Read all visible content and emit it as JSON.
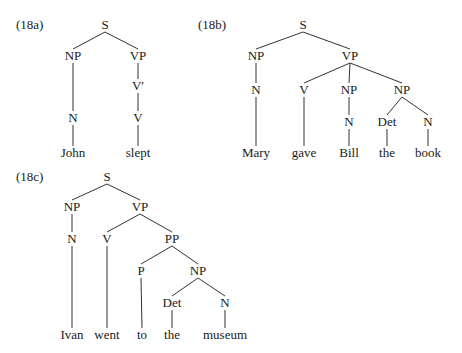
{
  "examples": [
    {
      "id": "18a",
      "label": "(18a)",
      "label_pos": [
        16,
        25
      ],
      "nodes": [
        {
          "text": "S",
          "x": 105,
          "y": 25
        },
        {
          "text": "NP",
          "x": 73,
          "y": 56
        },
        {
          "text": "VP",
          "x": 138,
          "y": 56
        },
        {
          "text": "V′",
          "x": 138,
          "y": 86
        },
        {
          "text": "N",
          "x": 73,
          "y": 118
        },
        {
          "text": "V",
          "x": 138,
          "y": 118
        },
        {
          "text": "John",
          "x": 73,
          "y": 153
        },
        {
          "text": "slept",
          "x": 138,
          "y": 153
        }
      ],
      "edges": [
        [
          0,
          1
        ],
        [
          0,
          2
        ],
        [
          2,
          3
        ],
        [
          3,
          5
        ],
        [
          1,
          4
        ],
        [
          4,
          6
        ],
        [
          5,
          7
        ]
      ]
    },
    {
      "id": "18b",
      "label": "(18b)",
      "label_pos": [
        198,
        25
      ],
      "nodes": [
        {
          "text": "S",
          "x": 303,
          "y": 25
        },
        {
          "text": "NP",
          "x": 256,
          "y": 56
        },
        {
          "text": "VP",
          "x": 350,
          "y": 56
        },
        {
          "text": "N",
          "x": 256,
          "y": 90
        },
        {
          "text": "V",
          "x": 304,
          "y": 90
        },
        {
          "text": "NP",
          "x": 349,
          "y": 90
        },
        {
          "text": "NP",
          "x": 402,
          "y": 90
        },
        {
          "text": "N",
          "x": 349,
          "y": 122
        },
        {
          "text": "Det",
          "x": 387,
          "y": 122
        },
        {
          "text": "N",
          "x": 428,
          "y": 122
        },
        {
          "text": "Mary",
          "x": 256,
          "y": 153
        },
        {
          "text": "gave",
          "x": 304,
          "y": 153
        },
        {
          "text": "Bill",
          "x": 349,
          "y": 153
        },
        {
          "text": "the",
          "x": 387,
          "y": 153
        },
        {
          "text": "book",
          "x": 428,
          "y": 153
        }
      ],
      "edges": [
        [
          0,
          1
        ],
        [
          0,
          2
        ],
        [
          1,
          3
        ],
        [
          2,
          4
        ],
        [
          2,
          5
        ],
        [
          2,
          6
        ],
        [
          5,
          7
        ],
        [
          6,
          8
        ],
        [
          6,
          9
        ],
        [
          3,
          10
        ],
        [
          4,
          11
        ],
        [
          7,
          12
        ],
        [
          8,
          13
        ],
        [
          9,
          14
        ]
      ]
    },
    {
      "id": "18c",
      "label": "(18c)",
      "label_pos": [
        16,
        177
      ],
      "nodes": [
        {
          "text": "S",
          "x": 107,
          "y": 177
        },
        {
          "text": "NP",
          "x": 72,
          "y": 207
        },
        {
          "text": "VP",
          "x": 140,
          "y": 207
        },
        {
          "text": "N",
          "x": 72,
          "y": 239
        },
        {
          "text": "V",
          "x": 107,
          "y": 239
        },
        {
          "text": "PP",
          "x": 172,
          "y": 239
        },
        {
          "text": "P",
          "x": 141,
          "y": 271
        },
        {
          "text": "NP",
          "x": 198,
          "y": 271
        },
        {
          "text": "Det",
          "x": 172,
          "y": 303
        },
        {
          "text": "N",
          "x": 225,
          "y": 303
        },
        {
          "text": "Ivan",
          "x": 72,
          "y": 335
        },
        {
          "text": "went",
          "x": 107,
          "y": 335
        },
        {
          "text": "to",
          "x": 142,
          "y": 335
        },
        {
          "text": "the",
          "x": 172,
          "y": 335
        },
        {
          "text": "museum",
          "x": 225,
          "y": 335
        }
      ],
      "edges": [
        [
          0,
          1
        ],
        [
          0,
          2
        ],
        [
          1,
          3
        ],
        [
          2,
          4
        ],
        [
          2,
          5
        ],
        [
          5,
          6
        ],
        [
          5,
          7
        ],
        [
          7,
          8
        ],
        [
          7,
          9
        ],
        [
          3,
          10
        ],
        [
          4,
          11
        ],
        [
          6,
          12
        ],
        [
          8,
          13
        ],
        [
          9,
          14
        ]
      ]
    }
  ]
}
